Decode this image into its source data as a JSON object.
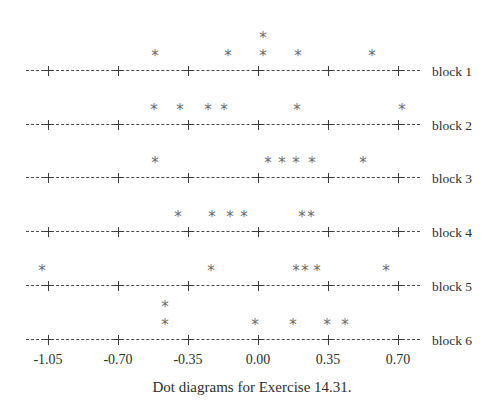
{
  "figure": {
    "caption": "Dot diagrams for Exercise 14.31.",
    "marker": "*",
    "axis_color": "#3b3b3b",
    "marker_color": "#6b6b6b"
  },
  "chart_data": {
    "type": "scatter",
    "title": "Dot diagrams for Exercise 14.31.",
    "xlabel": "",
    "ylabel": "",
    "xlim": [
      -1.19,
      0.81
    ],
    "xticks": [
      -1.05,
      -0.7,
      -0.35,
      0.0,
      0.35,
      0.7
    ],
    "xtick_labels": [
      "-1.05",
      "-0.70",
      "-0.35",
      "0.00",
      "0.35",
      "0.70"
    ],
    "grid": false,
    "legend": "none",
    "note": "Six stacked dot diagrams (one per block). Each value is plotted as an asterisk; repeated values stack vertically.",
    "series": [
      {
        "name": "block 1",
        "label": "block 1",
        "values": [
          -0.515,
          -0.15,
          0.025,
          0.025,
          0.2,
          0.57
        ],
        "stacks": [
          {
            "x": -0.515,
            "count": 1
          },
          {
            "x": -0.15,
            "count": 1
          },
          {
            "x": 0.025,
            "count": 2
          },
          {
            "x": 0.2,
            "count": 1
          },
          {
            "x": 0.57,
            "count": 1
          }
        ]
      },
      {
        "name": "block 2",
        "label": "block 2",
        "values": [
          -0.52,
          -0.39,
          -0.25,
          -0.17,
          0.195,
          0.72
        ],
        "stacks": [
          {
            "x": -0.52,
            "count": 1
          },
          {
            "x": -0.39,
            "count": 1
          },
          {
            "x": -0.25,
            "count": 1
          },
          {
            "x": -0.17,
            "count": 1
          },
          {
            "x": 0.195,
            "count": 1
          },
          {
            "x": 0.72,
            "count": 1
          }
        ]
      },
      {
        "name": "block 3",
        "label": "block 3",
        "values": [
          -0.515,
          0.05,
          0.12,
          0.19,
          0.27,
          0.525
        ],
        "stacks": [
          {
            "x": -0.515,
            "count": 1
          },
          {
            "x": 0.05,
            "count": 1
          },
          {
            "x": 0.12,
            "count": 1
          },
          {
            "x": 0.19,
            "count": 1
          },
          {
            "x": 0.27,
            "count": 1
          },
          {
            "x": 0.525,
            "count": 1
          }
        ]
      },
      {
        "name": "block 4",
        "label": "block 4",
        "values": [
          -0.4,
          -0.23,
          -0.14,
          -0.07,
          0.22,
          0.265
        ],
        "stacks": [
          {
            "x": -0.4,
            "count": 1
          },
          {
            "x": -0.23,
            "count": 1
          },
          {
            "x": -0.14,
            "count": 1
          },
          {
            "x": -0.07,
            "count": 1
          },
          {
            "x": 0.22,
            "count": 1
          },
          {
            "x": 0.265,
            "count": 1
          }
        ]
      },
      {
        "name": "block 5",
        "label": "block 5",
        "values": [
          -1.08,
          -0.235,
          0.19,
          0.235,
          0.295,
          0.64
        ],
        "stacks": [
          {
            "x": -1.08,
            "count": 1
          },
          {
            "x": -0.235,
            "count": 1
          },
          {
            "x": 0.19,
            "count": 1
          },
          {
            "x": 0.235,
            "count": 1
          },
          {
            "x": 0.295,
            "count": 1
          },
          {
            "x": 0.64,
            "count": 1
          }
        ]
      },
      {
        "name": "block 6",
        "label": "block 6",
        "values": [
          -0.465,
          -0.465,
          -0.015,
          0.175,
          0.345,
          0.435
        ],
        "stacks": [
          {
            "x": -0.465,
            "count": 2
          },
          {
            "x": -0.015,
            "count": 1
          },
          {
            "x": 0.175,
            "count": 1
          },
          {
            "x": 0.345,
            "count": 1
          },
          {
            "x": 0.435,
            "count": 1
          }
        ]
      }
    ]
  }
}
